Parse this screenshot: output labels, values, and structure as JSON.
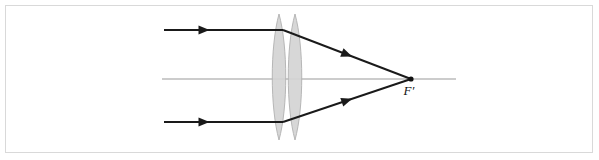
{
  "figure": {
    "background_color": "#ffffff",
    "frame_color": "#d9d9d9",
    "ink_color": "#1a1a1a",
    "axis_color": "#9a9a9a",
    "lens_fill_color": "#d4d4d4",
    "lens_stroke_color": "#b0b0b0"
  },
  "labels": {
    "focal_point": "F′"
  },
  "optical_axis": {
    "label": "optical-axis",
    "x_start": 162,
    "x_end": 456,
    "y": 79
  },
  "lens": {
    "label": "biconvex-doublet",
    "element_count": 2,
    "center_x": 287,
    "top_y": 14,
    "bottom_y": 140,
    "elements": [
      {
        "name": "lens-element-front",
        "center_x": 279,
        "half_width": 9
      },
      {
        "name": "lens-element-rear",
        "center_x": 295,
        "half_width": 9
      }
    ]
  },
  "focal_point": {
    "label": "focal-point",
    "x": 411,
    "y": 79,
    "dot_radius": 2.6,
    "text_x": 409,
    "text_y": 95
  },
  "rays": [
    {
      "name": "ray-upper",
      "incident": {
        "x1": 164,
        "y1": 30,
        "x2": 283,
        "y2": 30
      },
      "refracted": {
        "x1": 283,
        "y1": 30,
        "x2": 411,
        "y2": 79
      },
      "incident_arrow": {
        "x": 204,
        "y": 30,
        "angle": 0
      },
      "refracted_arrow": {
        "x": 347,
        "y": 54.5,
        "angle": 21
      }
    },
    {
      "name": "ray-lower",
      "incident": {
        "x1": 164,
        "y1": 122,
        "x2": 283,
        "y2": 122
      },
      "refracted": {
        "x1": 283,
        "y1": 122,
        "x2": 411,
        "y2": 79
      },
      "incident_arrow": {
        "x": 204,
        "y": 122,
        "angle": 0
      },
      "refracted_arrow": {
        "x": 347,
        "y": 100.5,
        "angle": -18.6
      }
    }
  ],
  "chart_data": {
    "type": "diagram",
    "elements": [
      "optical axis (horizontal grey line)",
      "two overlapping biconvex lens elements (shaded grey doublet)",
      "upper parallel incident ray with arrowhead",
      "lower parallel incident ray with arrowhead",
      "two refracted rays with arrowheads converging at F′",
      "focal point marker dot labelled F′"
    ],
    "annotations": [
      "F′"
    ]
  }
}
